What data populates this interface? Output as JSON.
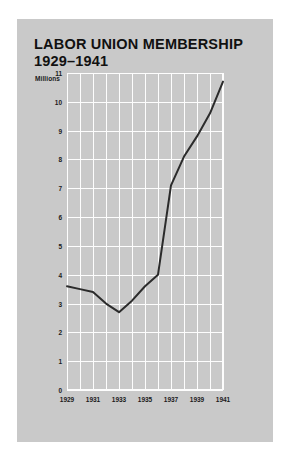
{
  "figure": {
    "background_color": "#c9c9c9",
    "grid_color": "#fdfdfd",
    "line_color": "#2b2b2b",
    "text_color": "#1a1a1a"
  },
  "title": {
    "line1": "LABOR UNION MEMBERSHIP",
    "line2": "1929–1941"
  },
  "chart_data": {
    "type": "line",
    "xlabel": "",
    "ylabel": "Millions",
    "unit_label": "Millions",
    "x": [
      1929,
      1930,
      1931,
      1932,
      1933,
      1934,
      1935,
      1936,
      1937,
      1938,
      1939,
      1940,
      1941
    ],
    "values": [
      3.6,
      3.5,
      3.4,
      3.0,
      2.7,
      3.1,
      3.6,
      4.0,
      7.1,
      8.1,
      8.8,
      9.6,
      10.7
    ],
    "xlim": [
      1929,
      1941
    ],
    "ylim": [
      0,
      11
    ],
    "xticks": [
      1929,
      1931,
      1933,
      1935,
      1937,
      1939,
      1941
    ],
    "xtick_labels": [
      "1929",
      "1931",
      "1933",
      "1935",
      "1937",
      "1939",
      "1941"
    ],
    "x_minor_step": 1,
    "yticks": [
      0,
      1,
      2,
      3,
      4,
      5,
      6,
      7,
      8,
      9,
      10,
      11
    ],
    "ytick_labels": [
      "0",
      "1",
      "2",
      "3",
      "4",
      "5",
      "6",
      "7",
      "8",
      "9",
      "10",
      "11"
    ],
    "grid": true,
    "legend": false,
    "legend_position": "none",
    "series": [
      {
        "name": "Labor union membership (millions)",
        "values": [
          3.6,
          3.5,
          3.4,
          3.0,
          2.7,
          3.1,
          3.6,
          4.0,
          7.1,
          8.1,
          8.8,
          9.6,
          10.7
        ]
      }
    ]
  }
}
